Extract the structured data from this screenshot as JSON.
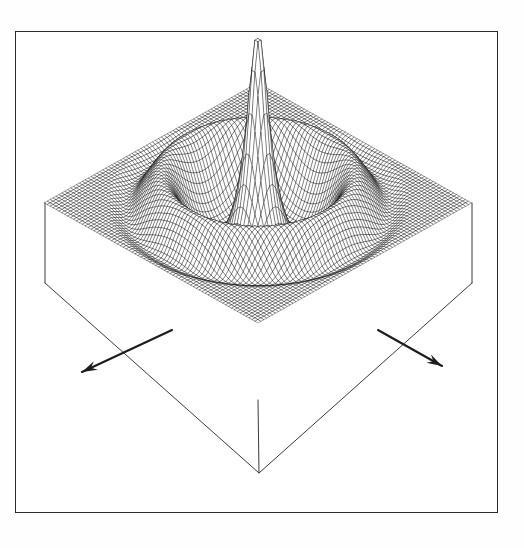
{
  "figure": {
    "title": "3D wireframe mesh surface plot",
    "caption_text": "",
    "background_color": "#fefefe",
    "paper_color": "#ffffff",
    "ink_color": "#1a1a1a",
    "frame": {
      "name": "plot-frame",
      "x": 15,
      "y": 31,
      "width": 483,
      "height": 482,
      "stroke_color": "#2b2b2b",
      "stroke_width": 1.4
    }
  },
  "chart_data": {
    "type": "surface",
    "title": "",
    "subtitle": "",
    "xlabel": "",
    "ylabel": "",
    "zlabel": "",
    "render_style": "wireframe-mesh-hidden-line",
    "mesh_line_color": "#111111",
    "mesh_line_width": 0.38,
    "grid": false,
    "legend": null,
    "function_description": "radially symmetric oscillating decay with central spike (Bessel/sinc-like diffraction pattern)",
    "formula": "z(r) = A0 * exp(-a*r) * cos(k*r) ^ shaped, plus narrow central spike",
    "params": {
      "amplitude": 1.0,
      "spike_amplitude": 1.62,
      "spike_width": 0.055,
      "ring_frequency": 3.05,
      "decay": 0.42,
      "ring_count": 4,
      "envelope_exponent": 1.0
    },
    "samples_u": 74,
    "samples_v": 74,
    "xlim": [
      -1,
      1
    ],
    "ylim": [
      -1,
      1
    ],
    "zlim": [
      0,
      1.62
    ],
    "projection": {
      "type": "isometric-oblique",
      "azimuth_deg": 45,
      "elevation_deg": 26,
      "x_scale": 213,
      "y_scale": 213,
      "z_scale": 152
    },
    "anchors": {
      "surface_left_corner": [
        45,
        203
      ],
      "surface_right_corner": [
        472,
        203
      ],
      "surface_front_corner": [
        258,
        400
      ],
      "surface_back_corner": [
        258,
        160
      ],
      "peak_apex": [
        259,
        100
      ],
      "base_front_corner": [
        259,
        473
      ],
      "base_left_corner": [
        45,
        283
      ],
      "base_right_corner": [
        472,
        283
      ]
    },
    "base_box": {
      "name": "pedestal-box",
      "visible": true,
      "stroke_color": "#3a3a3a",
      "stroke_width": 1.0,
      "depth_px": 73
    },
    "axis_arrows": [
      {
        "name": "axis-arrow-left",
        "direction": "down-left",
        "from": [
          172,
          330
        ],
        "to": [
          82,
          372
        ],
        "stroke_color": "#1c1c1c",
        "stroke_width": 2.1,
        "head_length": 16,
        "label": ""
      },
      {
        "name": "axis-arrow-right",
        "direction": "down-right",
        "from": [
          378,
          330
        ],
        "to": [
          442,
          366
        ],
        "stroke_color": "#1c1c1c",
        "stroke_width": 2.1,
        "head_length": 16,
        "label": ""
      }
    ]
  }
}
